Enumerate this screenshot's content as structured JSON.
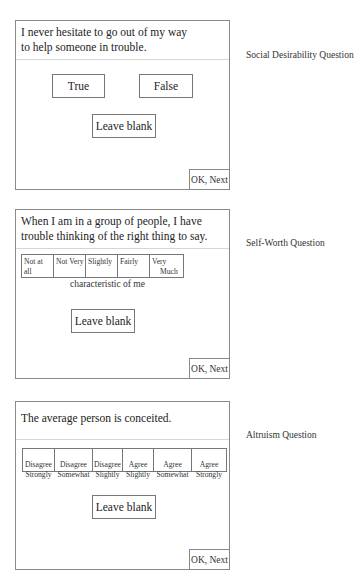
{
  "panels": [
    {
      "side_label": "Social Desirability Question",
      "question_lines": [
        "I never hesitate to go out of my way",
        "to help someone in trouble."
      ],
      "options": [
        "True",
        "False"
      ],
      "leave_blank": "Leave blank",
      "ok_next": "OK, Next"
    },
    {
      "side_label": "Self-Worth Question",
      "question_lines": [
        "When I am in a group of people, I have",
        "trouble thinking of the right thing to say."
      ],
      "scale": [
        "Not at all",
        "Not Very",
        "Slightly",
        "Fairly",
        "Very",
        "Much"
      ],
      "scale_caption": "characteristic of me",
      "leave_blank": "Leave blank",
      "ok_next": "OK, Next"
    },
    {
      "side_label": "Altruism Question",
      "question_lines": [
        "The average person is conceited."
      ],
      "scale": [
        {
          "line1": "Disagree",
          "line2": "Strongly"
        },
        {
          "line1": "Disagree",
          "line2": "Somewhat"
        },
        {
          "line1": "Disagree",
          "line2": "Slightly"
        },
        {
          "line1": "Agree",
          "line2": "Slightly"
        },
        {
          "line1": "Agree",
          "line2": "Somewhat"
        },
        {
          "line1": "Agree",
          "line2": "Strongly"
        }
      ],
      "leave_blank": "Leave blank",
      "ok_next": "OK, Next"
    }
  ]
}
